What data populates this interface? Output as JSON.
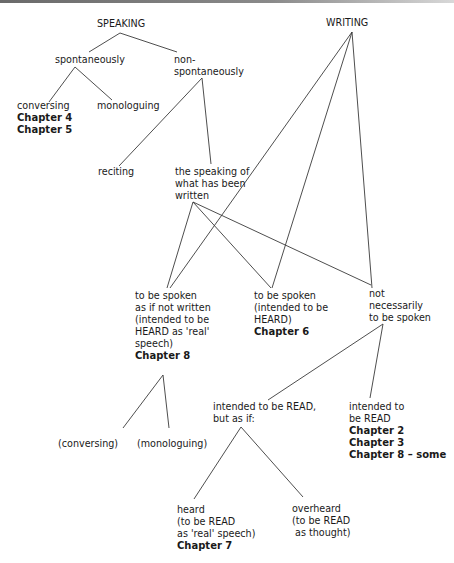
{
  "diagram": {
    "type": "tree",
    "roots": [
      "SPEAKING",
      "WRITING"
    ],
    "nodes": {
      "speaking": {
        "lines": [
          "SPEAKING"
        ],
        "bold": []
      },
      "writing": {
        "lines": [
          "WRITING"
        ],
        "bold": []
      },
      "spontaneously": {
        "lines": [
          "spontaneously"
        ],
        "bold": []
      },
      "non_spontaneously": {
        "lines": [
          "non-",
          "spontaneously"
        ],
        "bold": []
      },
      "conversing": {
        "lines": [
          "conversing"
        ],
        "bold": [
          "Chapter 4",
          "Chapter 5"
        ]
      },
      "monologuing": {
        "lines": [
          "monologuing"
        ],
        "bold": []
      },
      "reciting": {
        "lines": [
          "reciting"
        ],
        "bold": []
      },
      "speaking_written": {
        "lines": [
          "the speaking of",
          "what has been",
          "written"
        ],
        "bold": []
      },
      "spoken_as_if_not_written": {
        "lines": [
          "to be spoken",
          "as if not written",
          "(intended to be",
          "HEARD as 'real'",
          "speech)"
        ],
        "bold": [
          "Chapter 8"
        ]
      },
      "spoken_heard": {
        "lines": [
          "to be spoken",
          "(intended to be",
          "HEARD)"
        ],
        "bold": [
          "Chapter 6"
        ]
      },
      "not_necessarily_spoken": {
        "lines": [
          "not",
          "necessarily",
          "to be spoken"
        ],
        "bold": []
      },
      "conversing_paren": {
        "lines": [
          "(conversing)"
        ],
        "bold": []
      },
      "monologuing_paren": {
        "lines": [
          "(monologuing)"
        ],
        "bold": []
      },
      "read_but_as_if": {
        "lines": [
          "intended to be READ,",
          "but as if:"
        ],
        "bold": []
      },
      "intended_read": {
        "lines": [
          "intended to",
          "be READ"
        ],
        "bold": [
          "Chapter 2",
          "Chapter 3",
          "Chapter 8 –  some"
        ]
      },
      "heard": {
        "lines": [
          "heard",
          "(to be READ",
          "as 'real' speech)"
        ],
        "bold": [
          "Chapter 7"
        ]
      },
      "overheard": {
        "lines": [
          "overheard",
          "(to be READ",
          " as thought)"
        ],
        "bold": []
      }
    },
    "edges": [
      [
        "speaking",
        "spontaneously"
      ],
      [
        "speaking",
        "non_spontaneously"
      ],
      [
        "spontaneously",
        "conversing"
      ],
      [
        "spontaneously",
        "monologuing"
      ],
      [
        "non_spontaneously",
        "reciting"
      ],
      [
        "non_spontaneously",
        "speaking_written"
      ],
      [
        "writing",
        "spoken_as_if_not_written"
      ],
      [
        "writing",
        "spoken_heard"
      ],
      [
        "writing",
        "not_necessarily_spoken"
      ],
      [
        "speaking_written",
        "spoken_as_if_not_written"
      ],
      [
        "speaking_written",
        "spoken_heard"
      ],
      [
        "speaking_written",
        "not_necessarily_spoken"
      ],
      [
        "spoken_as_if_not_written",
        "conversing_paren"
      ],
      [
        "spoken_as_if_not_written",
        "monologuing_paren"
      ],
      [
        "not_necessarily_spoken",
        "read_but_as_if"
      ],
      [
        "not_necessarily_spoken",
        "intended_read"
      ],
      [
        "read_but_as_if",
        "heard"
      ],
      [
        "read_but_as_if",
        "overheard"
      ]
    ]
  }
}
